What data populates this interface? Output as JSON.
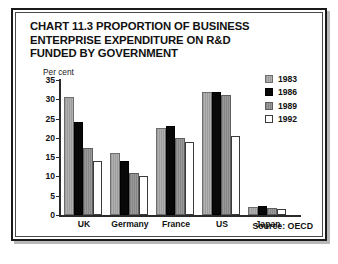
{
  "chart_data": {
    "type": "bar",
    "title": "CHART 11.3 PROPORTION OF BUSINESS ENTERPRISE EXPENDITURE ON R&D FUNDED BY GOVERNMENT",
    "title_lines": [
      "CHART 11.3 PROPORTION OF BUSINESS",
      "ENTERPRISE EXPENDITURE ON R&D",
      "FUNDED BY GOVERNMENT"
    ],
    "xlabel": "",
    "ylabel": "Per cent",
    "ylim": [
      0,
      35
    ],
    "ytick_step": 5,
    "yticks": [
      35,
      30,
      25,
      20,
      15,
      10,
      5,
      0
    ],
    "grid": false,
    "legend_position": "top-right",
    "categories": [
      "UK",
      "Germany",
      "France",
      "US",
      "Japan"
    ],
    "series": [
      {
        "name": "1983",
        "color": "#a8a8a8",
        "values": [
          30.5,
          16.0,
          22.5,
          32.0,
          2.0
        ]
      },
      {
        "name": "1986",
        "color": "#080808",
        "values": [
          24.0,
          14.0,
          23.0,
          32.0,
          2.3
        ]
      },
      {
        "name": "1989",
        "color": "#909090",
        "values": [
          17.5,
          11.0,
          20.0,
          31.0,
          1.7
        ]
      },
      {
        "name": "1992",
        "color": "#ffffff",
        "values": [
          14.0,
          10.0,
          19.0,
          20.5,
          1.5
        ]
      }
    ],
    "source": "Source: OECD"
  },
  "figure": {
    "source_note": "Source: OECD"
  }
}
